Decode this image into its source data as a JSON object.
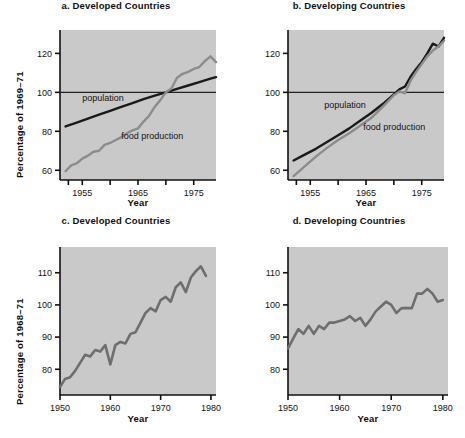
{
  "figure": {
    "background": "#ffffff",
    "plot_background": "#c9c9c9",
    "axis_color": "#111111",
    "population_color": "#1a1a1a",
    "food_color": "#8c8c8c",
    "single_line_color": "#6e6e6e"
  },
  "chart_data": [
    {
      "id": "a",
      "type": "line",
      "title": "a. Developed Countries",
      "xlabel": "Year",
      "ylabel": "Percentage of 1969–71",
      "xlim": [
        1951,
        1979
      ],
      "ylim": [
        55,
        132
      ],
      "grid": false,
      "legend": "inline-annotations",
      "reference_line": {
        "y": 100,
        "label": "100"
      },
      "yticks": [
        60,
        80,
        100,
        120
      ],
      "ytick_labels": [
        "60",
        "80",
        "100",
        "120"
      ],
      "xticks": [
        1952.5,
        1955,
        1960,
        1965,
        1970,
        1975
      ],
      "xtick_labels": [
        "",
        "1955",
        "",
        "1965",
        "",
        "1975"
      ],
      "annotations": [
        {
          "text": "population",
          "x": 1955.0,
          "y": 95.5
        },
        {
          "text": "food production",
          "x": 1962.0,
          "y": 76.0
        }
      ],
      "series": [
        {
          "name": "population",
          "color": "#1a1a1a",
          "x": [
            1952,
            1954,
            1956,
            1958,
            1960,
            1962,
            1964,
            1966,
            1968,
            1970,
            1972,
            1974,
            1976,
            1978,
            1979
          ],
          "values": [
            82.5,
            84.5,
            86.5,
            88.5,
            90.5,
            92.5,
            94.5,
            96.5,
            98.3,
            100.0,
            101.8,
            103.5,
            105.2,
            107.0,
            107.8
          ]
        },
        {
          "name": "food production",
          "color": "#8c8c8c",
          "x": [
            1952,
            1953,
            1954,
            1955,
            1956,
            1957,
            1958,
            1959,
            1960,
            1961,
            1962,
            1963,
            1964,
            1965,
            1966,
            1967,
            1968,
            1969,
            1970,
            1971,
            1972,
            1973,
            1974,
            1975,
            1976,
            1977,
            1978,
            1979
          ],
          "values": [
            59.5,
            62.5,
            63.5,
            66.0,
            67.5,
            69.5,
            70.0,
            73.0,
            74.0,
            75.5,
            77.0,
            79.0,
            80.5,
            81.5,
            85.0,
            88.0,
            92.5,
            96.0,
            100.0,
            102.0,
            107.5,
            109.5,
            110.5,
            112.0,
            113.0,
            116.0,
            118.5,
            115.5
          ]
        }
      ]
    },
    {
      "id": "b",
      "type": "line",
      "title": "b. Developing Countries",
      "xlabel": "Year",
      "ylabel": "",
      "xlim": [
        1951,
        1979
      ],
      "ylim": [
        55,
        132
      ],
      "grid": false,
      "legend": "inline-annotations",
      "reference_line": {
        "y": 100,
        "label": "100"
      },
      "yticks": [
        60,
        80,
        100,
        120
      ],
      "ytick_labels": [
        "60",
        "80",
        "100",
        "120"
      ],
      "xticks": [
        1952.5,
        1955,
        1960,
        1965,
        1970,
        1975
      ],
      "xtick_labels": [
        "",
        "1955",
        "",
        "1965",
        "",
        "1975"
      ],
      "annotations": [
        {
          "text": "population",
          "x": 1957.5,
          "y": 92.0
        },
        {
          "text": "food production",
          "x": 1964.5,
          "y": 80.5
        }
      ],
      "series": [
        {
          "name": "population",
          "color": "#1a1a1a",
          "x": [
            1952,
            1954,
            1956,
            1958,
            1960,
            1962,
            1964,
            1966,
            1968,
            1970,
            1971,
            1972,
            1973,
            1974,
            1975,
            1976,
            1977,
            1978,
            1979
          ],
          "values": [
            65.0,
            68.0,
            71.0,
            74.5,
            78.0,
            81.5,
            85.5,
            89.5,
            94.0,
            99.0,
            101.5,
            103.0,
            108.0,
            112.0,
            115.5,
            120.0,
            125.0,
            123.5,
            128.0
          ]
        },
        {
          "name": "food production",
          "color": "#8c8c8c",
          "x": [
            1952,
            1954,
            1956,
            1958,
            1960,
            1962,
            1964,
            1966,
            1968,
            1970,
            1971,
            1972,
            1973,
            1974,
            1975,
            1976,
            1977,
            1978,
            1979
          ],
          "values": [
            57.0,
            62.0,
            67.0,
            71.5,
            75.5,
            79.0,
            83.0,
            87.0,
            92.5,
            98.5,
            100.5,
            99.5,
            106.0,
            110.5,
            114.5,
            118.5,
            121.5,
            123.5,
            126.5
          ]
        }
      ]
    },
    {
      "id": "c",
      "type": "line",
      "title": "c. Developed Countries",
      "xlabel": "Year",
      "ylabel": "Percentage of 1968–71",
      "xlim": [
        1950,
        1981
      ],
      "ylim": [
        72,
        118
      ],
      "grid": false,
      "legend": "none",
      "yticks": [
        80,
        90,
        100,
        110
      ],
      "ytick_labels": [
        "80",
        "90",
        "100",
        "110"
      ],
      "xticks": [
        1950,
        1960,
        1970,
        1980
      ],
      "xtick_labels": [
        "1950",
        "1960",
        "1970",
        "1980"
      ],
      "series": [
        {
          "name": "food production per capita",
          "color": "#6e6e6e",
          "x": [
            1950,
            1951,
            1952,
            1953,
            1954,
            1955,
            1956,
            1957,
            1958,
            1959,
            1960,
            1961,
            1962,
            1963,
            1964,
            1965,
            1966,
            1967,
            1968,
            1969,
            1970,
            1971,
            1972,
            1973,
            1974,
            1975,
            1976,
            1977,
            1978,
            1979
          ],
          "values": [
            74.5,
            77.0,
            77.5,
            79.5,
            82.0,
            84.5,
            84.0,
            86.0,
            85.5,
            87.5,
            81.5,
            87.5,
            88.5,
            88.0,
            91.0,
            91.5,
            94.5,
            97.5,
            99.0,
            98.0,
            101.5,
            102.5,
            101.0,
            105.5,
            107.0,
            104.0,
            108.5,
            110.5,
            112.0,
            109.0
          ]
        }
      ]
    },
    {
      "id": "d",
      "type": "line",
      "title": "d. Developing Countries",
      "xlabel": "Year",
      "ylabel": "",
      "xlim": [
        1950,
        1981
      ],
      "ylim": [
        72,
        118
      ],
      "grid": false,
      "legend": "none",
      "yticks": [
        80,
        90,
        100,
        110
      ],
      "ytick_labels": [
        "80",
        "90",
        "100",
        "110"
      ],
      "xticks": [
        1950,
        1960,
        1970,
        1980
      ],
      "xtick_labels": [
        "1950",
        "1960",
        "1970",
        "1980"
      ],
      "series": [
        {
          "name": "food production per capita",
          "color": "#6e6e6e",
          "x": [
            1950,
            1951,
            1952,
            1953,
            1954,
            1955,
            1956,
            1957,
            1958,
            1959,
            1960,
            1961,
            1962,
            1963,
            1964,
            1965,
            1966,
            1967,
            1968,
            1969,
            1970,
            1971,
            1972,
            1973,
            1974,
            1975,
            1976,
            1977,
            1978,
            1979,
            1980
          ],
          "values": [
            86.5,
            89.5,
            92.5,
            91.0,
            93.5,
            91.0,
            93.5,
            92.5,
            94.5,
            94.5,
            95.0,
            95.5,
            96.5,
            95.0,
            96.0,
            93.5,
            95.5,
            98.0,
            99.5,
            101.0,
            100.0,
            97.5,
            99.0,
            99.0,
            99.0,
            103.5,
            103.5,
            105.0,
            103.5,
            101.0,
            101.5
          ]
        }
      ]
    }
  ]
}
